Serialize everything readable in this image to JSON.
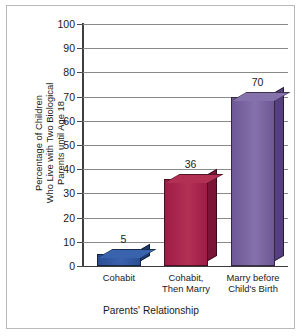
{
  "chart_data": {
    "type": "bar",
    "title": "",
    "categories": [
      "Cohabit",
      "Cohabit, Then Marry",
      "Marry before Child's Birth"
    ],
    "values": [
      5,
      36,
      70
    ],
    "value_labels": [
      "5",
      "36",
      "70"
    ],
    "xlabel": "Parents' Relationship",
    "ylabel": "Percentage of Children Who Live with Two Biological Parents until Age 18",
    "ylabel_lines": [
      "Percentage of Children",
      "Who Live with Two Biological",
      "Parents until Age 18"
    ],
    "ylim": [
      0,
      100
    ],
    "ytick_step": 10,
    "yticks": [
      100,
      90,
      80,
      70,
      60,
      50,
      40,
      30,
      20,
      10,
      0
    ],
    "ytick_labels": [
      "100",
      "90",
      "80",
      "70",
      "60",
      "50",
      "40",
      "30",
      "20",
      "10",
      "0"
    ],
    "grid": true,
    "legend": false,
    "style": "3d-bars",
    "bar_colors": [
      "#2b4f94",
      "#9e1d47",
      "#6e5795"
    ],
    "bar_top_colors": [
      "#3a63ad",
      "#b33055",
      "#8672ab"
    ],
    "bar_side_colors": [
      "#1d3a73",
      "#7a1538",
      "#553f7c"
    ],
    "axis_color": "#3f3f3f",
    "grid_color": "#8a8a8a",
    "frame_color": "#b9b9b9",
    "background": "#ffffff"
  },
  "categories_display": [
    {
      "line1": "Cohabit",
      "line2": ""
    },
    {
      "line1": "Cohabit,",
      "line2": "Then Marry"
    },
    {
      "line1": "Marry before",
      "line2": "Child's Birth"
    }
  ]
}
